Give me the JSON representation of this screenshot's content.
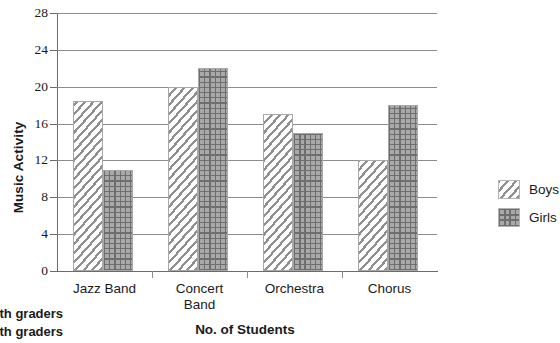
{
  "chart_data": {
    "type": "bar",
    "title": "",
    "xlabel": "No. of Students",
    "ylabel": "Music Activity",
    "categories": [
      "Jazz Band",
      "Concert Band",
      "Orchestra",
      "Chorus"
    ],
    "series": [
      {
        "name": "Boys",
        "values": [
          18.5,
          20,
          17,
          12
        ]
      },
      {
        "name": "Girls",
        "values": [
          11,
          22,
          15,
          18
        ]
      }
    ],
    "ylim": [
      0,
      28
    ],
    "ytick_step": 4,
    "yticks": [
      0,
      4,
      8,
      12,
      16,
      20,
      24,
      28
    ],
    "ytick_labels": [
      "0",
      "4",
      "8",
      "12",
      "16",
      "20",
      "24",
      "28"
    ],
    "grid": "horizontal",
    "legend_position": "right",
    "legend": [
      {
        "label": "Boys",
        "pattern": "diagonal-hatch"
      },
      {
        "label": "Girls",
        "pattern": "grid-dots"
      }
    ],
    "colors": {
      "boys_hatch": "#8f8f8f",
      "girls_fill": "#a9a9a9",
      "girls_grid": "#6e6e6e",
      "gridline": "#8c8c8c",
      "axis": "#6b6b6b",
      "text": "#1a1a1a",
      "background": "#ffffff"
    }
  },
  "axis": {
    "y_title": "Music Activity",
    "x_title": "No. of Students"
  },
  "category_labels": [
    {
      "line1": "Jazz Band",
      "line2": ""
    },
    {
      "line1": "Concert",
      "line2": "Band"
    },
    {
      "line1": "Orchestra",
      "line2": ""
    },
    {
      "line1": "Chorus",
      "line2": ""
    }
  ],
  "captions": {
    "line1": "Sixth graders",
    "line2": "Sixth graders"
  }
}
